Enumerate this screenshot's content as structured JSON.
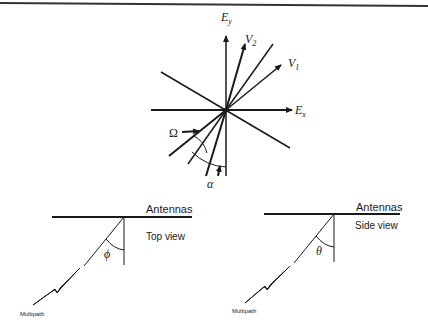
{
  "vector_diagram": {
    "axis_x_label": "E",
    "axis_x_sub": "x",
    "axis_y_label": "E",
    "axis_y_sub": "y",
    "vector1_label": "V",
    "vector1_sub": "1",
    "vector2_label": "V",
    "vector2_sub": "2",
    "omega_label": "Ω",
    "alpha_label": "α"
  },
  "top_view": {
    "antennas_label": "Antennas",
    "view_label": "Top view",
    "angle_label": "ϕ",
    "multipath_label": "Multipath"
  },
  "side_view": {
    "antennas_label": "Antennas",
    "view_label": "Side view",
    "angle_label": "θ",
    "multipath_label": "Multipath"
  },
  "colors": {
    "ink": "#1a1a1a",
    "background": "#ffffff",
    "rule": "#333333"
  }
}
